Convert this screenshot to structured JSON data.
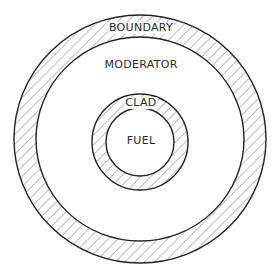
{
  "diagram": {
    "type": "concentric-cell-cross-section",
    "colors": {
      "stroke": "#222222",
      "hatch": "#555555",
      "background": "#ffffff"
    },
    "regions": [
      {
        "id": "boundary",
        "label": "BOUNDARY",
        "hatched": true
      },
      {
        "id": "moderator",
        "label": "MODERATOR",
        "hatched": false
      },
      {
        "id": "clad",
        "label": "CLAD",
        "hatched": true
      },
      {
        "id": "fuel",
        "label": "FUEL",
        "hatched": false
      }
    ]
  }
}
